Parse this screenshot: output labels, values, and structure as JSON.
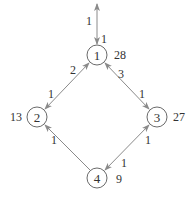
{
  "diagram": {
    "type": "directed-graph",
    "nodes": [
      {
        "id": "1",
        "label": "1",
        "value": "28",
        "cx": 97,
        "cy": 55
      },
      {
        "id": "2",
        "label": "2",
        "value": "13",
        "cx": 37,
        "cy": 117
      },
      {
        "id": "3",
        "label": "3",
        "value": "27",
        "cx": 157,
        "cy": 117
      },
      {
        "id": "4",
        "label": "4",
        "value": "9",
        "cx": 97,
        "cy": 178
      }
    ],
    "edges": [
      {
        "id": "ext-1",
        "from": "external",
        "to": "1",
        "bidirectional": true,
        "label_far": "1",
        "label_near": "1"
      },
      {
        "id": "1-2",
        "from": "1",
        "to": "2",
        "bidirectional": true,
        "label_at_1": "2",
        "label_at_2": "1"
      },
      {
        "id": "1-3",
        "from": "1",
        "to": "3",
        "bidirectional": true,
        "label_at_1": "3",
        "label_at_3": "1"
      },
      {
        "id": "4-2",
        "from": "4",
        "to": "2",
        "bidirectional": false,
        "label_at_2": "1"
      },
      {
        "id": "3-4",
        "from": "3",
        "to": "4",
        "bidirectional": true,
        "label_at_3": "1",
        "label_at_4": "1"
      }
    ],
    "colors": {
      "edge": "#8a8a8a",
      "node_stroke": "#6a6a6a",
      "text": "#333333"
    }
  }
}
